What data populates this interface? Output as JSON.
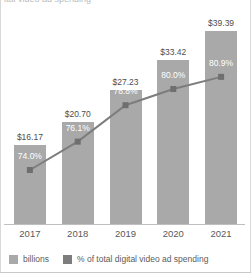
{
  "title_fragment": "ital video ad spending",
  "colors": {
    "bar": "#a9a9a9",
    "line": "#7d7d7d",
    "marker": "#6f6f6f",
    "bar_label": "#4d4d4d",
    "pct_label": "#ffffff",
    "axis": "#bfbfbf",
    "tick_label": "#59595b",
    "legend_text": "#5b5b5d",
    "frame": "#d9d9d9",
    "background": "#ffffff"
  },
  "legend": {
    "position": "bottom-left",
    "items": [
      {
        "label": "billions",
        "swatch": "#a9a9a9",
        "icon": "legend-swatch-bars"
      },
      {
        "label": "% of total digital video ad spending",
        "swatch": "#7d7d7d",
        "icon": "legend-swatch-line"
      }
    ]
  },
  "chart_data": {
    "type": "bar",
    "title": "",
    "xlabel": "",
    "ylabel": "",
    "grid": false,
    "categories": [
      "2017",
      "2018",
      "2019",
      "2020",
      "2021"
    ],
    "series": [
      {
        "name": "billions",
        "type": "bar",
        "axis": "left",
        "value_prefix": "$",
        "values": [
          16.17,
          20.7,
          27.23,
          33.42,
          39.39
        ],
        "labels": [
          "$16.17",
          "$20.70",
          "$27.23",
          "$33.42",
          "$39.39"
        ],
        "ylim": [
          0,
          44
        ]
      },
      {
        "name": "% of total digital video ad spending",
        "type": "line",
        "axis": "right",
        "value_suffix": "%",
        "values": [
          74.0,
          76.1,
          78.8,
          80.0,
          80.9
        ],
        "labels": [
          "74.0%",
          "76.1%",
          "78.8%",
          "80.0%",
          "80.9%"
        ],
        "ylim": [
          70,
          86
        ],
        "marker": "square"
      }
    ]
  }
}
